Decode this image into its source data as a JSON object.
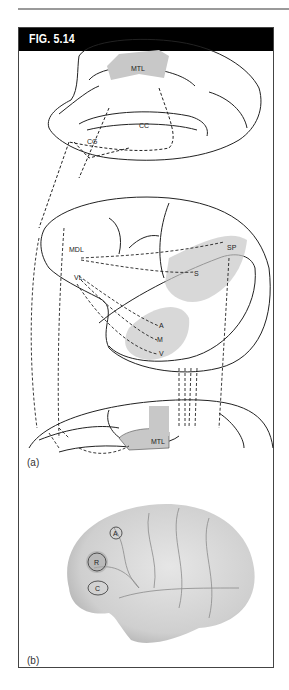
{
  "figure": {
    "title": "FIG. 5.14",
    "panels": [
      {
        "label": "(a)",
        "description": "Line drawings of brain views with dashed connection arrows",
        "region_labels": [
          "MTL",
          "CC",
          "CG",
          "MDL",
          "VL",
          "SP",
          "S",
          "A",
          "M",
          "V",
          "MTL"
        ]
      },
      {
        "label": "(b)",
        "description": "Lateral brain photograph with circled regions",
        "region_labels": [
          "A",
          "R",
          "C"
        ]
      }
    ]
  },
  "colors": {
    "header_bg": "#000000",
    "header_text": "#ffffff",
    "frame_border": "#444444",
    "shading": "#c8c8c8"
  }
}
